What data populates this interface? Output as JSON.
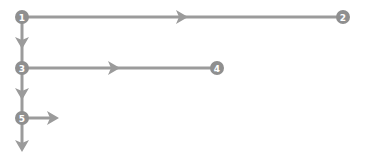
{
  "diagram": {
    "colors": {
      "line": "#9b9b9b",
      "node": "#8f8f8f",
      "label": "#ffffff",
      "background": "#ffffff"
    },
    "nodes": [
      {
        "id": "1",
        "label": "1",
        "x": 22,
        "y": 17
      },
      {
        "id": "2",
        "label": "2",
        "x": 343,
        "y": 17
      },
      {
        "id": "3",
        "label": "3",
        "x": 22,
        "y": 68
      },
      {
        "id": "4",
        "label": "4",
        "x": 217,
        "y": 68
      },
      {
        "id": "5",
        "label": "5",
        "x": 22,
        "y": 118
      }
    ],
    "edges": [
      {
        "from": "1",
        "to": "2",
        "direction": "right"
      },
      {
        "from": "1",
        "to": "3",
        "direction": "down"
      },
      {
        "from": "3",
        "to": "4",
        "direction": "right"
      },
      {
        "from": "3",
        "to": "5",
        "direction": "down"
      },
      {
        "from": "5",
        "to": null,
        "direction": "right"
      },
      {
        "from": "5",
        "to": null,
        "direction": "down"
      }
    ]
  }
}
